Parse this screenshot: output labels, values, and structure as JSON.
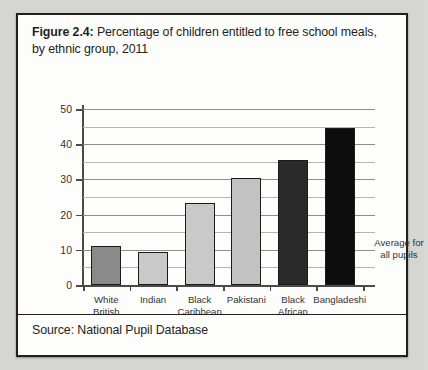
{
  "figure": {
    "label": "Figure 2.4:",
    "caption": " Percentage of children entitled to free school meals, by ethnic group, 2011",
    "source": "Source: National Pupil Database",
    "annotation_line1": "Average for",
    "annotation_line2": "all pupils"
  },
  "colors": {
    "bar_white_british": "#8a8a8a",
    "bar_indian": "#c9c9c9",
    "bar_black_caribbean": "#c9c9c9",
    "bar_pakistani": "#c2c2c2",
    "bar_black_african": "#2a2a2a",
    "bar_bangladeshi": "#0d0d0d",
    "gridline": "#b4b4b4",
    "axis": "#4a4a4a",
    "frame": "#231f1d",
    "page_background": "#d5d5d2",
    "figure_background": "#fdfdfc"
  },
  "chart_data": {
    "type": "bar",
    "title": "Figure 2.4: Percentage of children entitled to free school meals, by ethnic group, 2011",
    "xlabel": "",
    "ylabel": "",
    "categories": [
      "White British",
      "Indian",
      "Black Caribbean",
      "Pakistani",
      "Black African",
      "Bangladeshi"
    ],
    "category_lines": [
      [
        "White",
        "British"
      ],
      [
        "Indian",
        ""
      ],
      [
        "Black",
        "Caribbean"
      ],
      [
        "Pakistani",
        ""
      ],
      [
        "Black",
        "African"
      ],
      [
        "Bangladeshi",
        ""
      ]
    ],
    "values": [
      11,
      9.5,
      23.4,
      30.4,
      35.5,
      44.6
    ],
    "bar_colors": [
      "#8a8a8a",
      "#c9c9c9",
      "#c9c9c9",
      "#c2c2c2",
      "#2a2a2a",
      "#0d0d0d"
    ],
    "ylim": [
      0,
      52
    ],
    "yticks": [
      0,
      10,
      20,
      30,
      40,
      50
    ],
    "ytick_labels": [
      "0",
      "10",
      "20",
      "30",
      "40",
      "50"
    ],
    "yminor_ticks": [
      5,
      15,
      25,
      35,
      45
    ],
    "grid": true,
    "legend": false,
    "annotations": [
      {
        "text": "Average for all pupils",
        "position": "right-of-plot",
        "value_level": 14
      }
    ],
    "source": "Source: National Pupil Database"
  }
}
